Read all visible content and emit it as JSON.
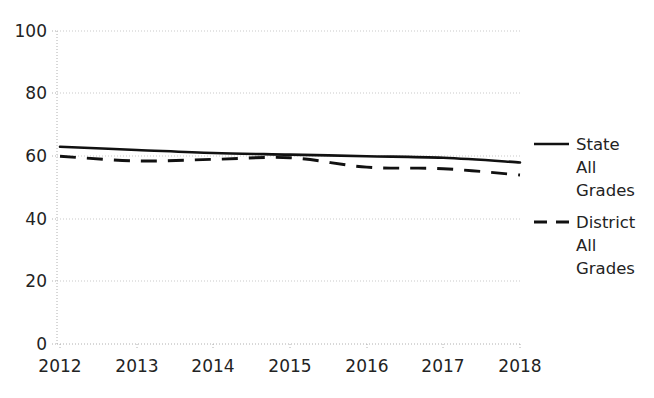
{
  "chart_data": {
    "type": "line",
    "title": "",
    "xlabel": "",
    "ylabel": "",
    "x": [
      2012,
      2013,
      2014,
      2015,
      2016,
      2017,
      2018
    ],
    "categories": [
      "2012",
      "2013",
      "2014",
      "2015",
      "2016",
      "2017",
      "2018"
    ],
    "series": [
      {
        "name": "State All Grades",
        "style": "solid",
        "color": "#111111",
        "values": [
          63,
          62,
          61,
          60.5,
          60,
          59.5,
          58
        ]
      },
      {
        "name": "District All Grades",
        "style": "dashed",
        "color": "#111111",
        "values": [
          60,
          58.5,
          59,
          59.5,
          56.5,
          56,
          54
        ]
      }
    ],
    "ylim": [
      0,
      100
    ],
    "xlim": [
      2012,
      2018
    ],
    "y_ticks": [
      0,
      20,
      40,
      60,
      80,
      100
    ],
    "y_tick_labels": [
      "0",
      "20",
      "40",
      "60",
      "80",
      "100"
    ],
    "x_ticks": [
      2012,
      2013,
      2014,
      2015,
      2016,
      2017,
      2018
    ],
    "x_tick_labels": [
      "2012",
      "2013",
      "2014",
      "2015",
      "2016",
      "2017",
      "2018"
    ],
    "grid": "dotted-light",
    "legend_position": "right"
  },
  "axes": {
    "y_tick_labels": [
      "100",
      "80",
      "60",
      "40",
      "20",
      "0"
    ],
    "x_tick_labels": [
      "2012",
      "2013",
      "2014",
      "2015",
      "2016",
      "2017",
      "2018"
    ]
  },
  "legend": {
    "entries": [
      {
        "line1": "State",
        "line2": "All",
        "line3": "Grades",
        "swatch": "solid-line-swatch"
      },
      {
        "line1": "District",
        "line2": "All",
        "line3": "Grades",
        "swatch": "dashed-line-swatch"
      }
    ]
  },
  "colors": {
    "series": "#111111",
    "grid": "#c9c9c9",
    "text": "#232323",
    "background": "#ffffff"
  }
}
